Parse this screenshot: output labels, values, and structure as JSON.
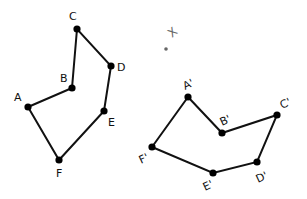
{
  "diagram": {
    "title": "",
    "original": {
      "vertices": [
        {
          "label": "A",
          "x": 28,
          "y": 107,
          "lx": 14,
          "ly": 101
        },
        {
          "label": "B",
          "x": 72,
          "y": 88,
          "lx": 60,
          "ly": 82
        },
        {
          "label": "C",
          "x": 77,
          "y": 29,
          "lx": 69,
          "ly": 20
        },
        {
          "label": "D",
          "x": 111,
          "y": 66,
          "lx": 117,
          "ly": 71
        },
        {
          "label": "E",
          "x": 104,
          "y": 111,
          "lx": 108,
          "ly": 126
        },
        {
          "label": "F",
          "x": 59,
          "y": 160,
          "lx": 56,
          "ly": 177
        }
      ]
    },
    "image": {
      "vertices": [
        {
          "label": "A'",
          "x": 188,
          "y": 97,
          "lx": 185,
          "ly": 90
        },
        {
          "label": "B'",
          "x": 222,
          "y": 133,
          "lx": 222,
          "ly": 126
        },
        {
          "label": "C'",
          "x": 277,
          "y": 115,
          "lx": 282,
          "ly": 109
        },
        {
          "label": "D'",
          "x": 257,
          "y": 162,
          "lx": 258,
          "ly": 183
        },
        {
          "label": "E'",
          "x": 213,
          "y": 173,
          "lx": 205,
          "ly": 191
        },
        {
          "label": "F'",
          "x": 152,
          "y": 147,
          "lx": 141,
          "ly": 164
        }
      ]
    },
    "center": {
      "label": "X",
      "label_x": 172,
      "label_y": 38,
      "dot_x": 166,
      "dot_y": 49
    },
    "colors": {
      "stroke": "#111111",
      "point": "#000000"
    }
  }
}
